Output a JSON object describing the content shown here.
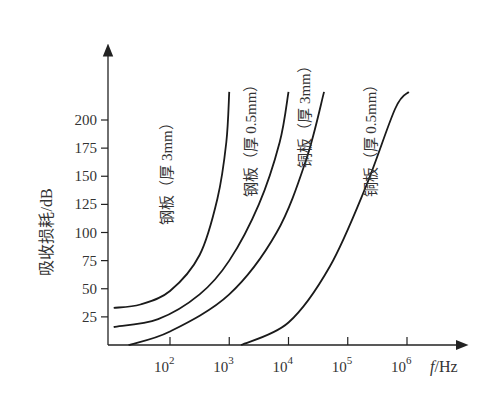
{
  "chart_data": {
    "type": "line",
    "title": "",
    "xlabel": "f/Hz",
    "ylabel": "吸收损耗/dB",
    "x_scale": "log",
    "x_ticks": [
      {
        "exp": 2,
        "label": "10",
        "sup": "2"
      },
      {
        "exp": 3,
        "label": "10",
        "sup": "3"
      },
      {
        "exp": 4,
        "label": "10",
        "sup": "4"
      },
      {
        "exp": 5,
        "label": "10",
        "sup": "5"
      },
      {
        "exp": 6,
        "label": "10",
        "sup": "6"
      }
    ],
    "y_ticks": [
      25,
      50,
      75,
      100,
      125,
      150,
      175,
      200
    ],
    "ylim": [
      0,
      230
    ],
    "xlim_exp": [
      1.05,
      6.9
    ],
    "grid": false,
    "legend": "inline labels",
    "series": [
      {
        "name": "钢板（厚 3mm）",
        "points": [
          [
            1.05,
            33
          ],
          [
            1.5,
            36
          ],
          [
            2.0,
            48
          ],
          [
            2.5,
            80
          ],
          [
            2.8,
            130
          ],
          [
            2.95,
            180
          ],
          [
            3.0,
            225
          ]
        ]
      },
      {
        "name": "钢板（厚 0.5mm）",
        "points": [
          [
            1.05,
            16
          ],
          [
            1.8,
            23
          ],
          [
            2.5,
            45
          ],
          [
            3.0,
            75
          ],
          [
            3.5,
            125
          ],
          [
            3.85,
            180
          ],
          [
            4.0,
            225
          ]
        ]
      },
      {
        "name": "铜板（厚 3mm）",
        "points": [
          [
            1.3,
            0
          ],
          [
            2.0,
            12
          ],
          [
            3.0,
            45
          ],
          [
            3.8,
            100
          ],
          [
            4.3,
            165
          ],
          [
            4.6,
            225
          ]
        ]
      },
      {
        "name": "铜板（厚 0.5mm）",
        "points": [
          [
            3.2,
            0
          ],
          [
            4.0,
            20
          ],
          [
            4.7,
            70
          ],
          [
            5.3,
            140
          ],
          [
            5.8,
            210
          ],
          [
            6.03,
            225
          ]
        ]
      }
    ]
  },
  "labels": {
    "ylabel": "吸收损耗/dB",
    "xlabel_f": "f",
    "xlabel_unit": "/Hz",
    "curves": [
      "钢板（厚 3mm）",
      "钢板（厚 0.5mm）",
      "铜板（厚 3mm）",
      "铜板（厚 0.5mm）"
    ]
  }
}
